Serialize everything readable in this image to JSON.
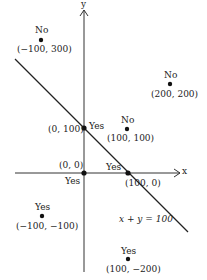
{
  "diagram": {
    "axes": {
      "x_label": "x",
      "y_label": "y"
    },
    "line": {
      "equation": "x + y = 100"
    },
    "points": [
      {
        "coord": "(−100, 300)",
        "answer": "No"
      },
      {
        "coord": "(200, 200)",
        "answer": "No"
      },
      {
        "coord": "(0, 100)",
        "answer": "Yes"
      },
      {
        "coord": "(100, 100)",
        "answer": "No"
      },
      {
        "coord": "(0, 0)",
        "answer": "Yes"
      },
      {
        "coord": "(100, 0)",
        "answer": "Yes"
      },
      {
        "coord": "(−100, −100)",
        "answer": "Yes"
      },
      {
        "coord": "(100, −200)",
        "answer": "Yes"
      }
    ]
  }
}
